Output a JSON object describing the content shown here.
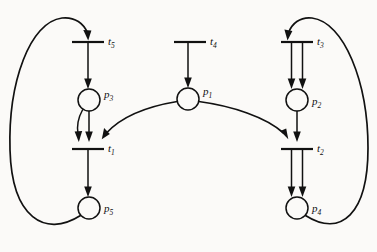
{
  "figure": {
    "kind": "petri-net-diagram",
    "background_color": "#fbfaf8",
    "ink_color": "#111111",
    "width": 377,
    "height": 252
  },
  "places": [
    {
      "id": "p1",
      "label": "p",
      "sub": "1",
      "cx": 188,
      "cy": 99,
      "r": 11,
      "label_x": 203,
      "label_y": 95,
      "tokens": 0
    },
    {
      "id": "p2",
      "label": "p",
      "sub": "2",
      "cx": 297,
      "cy": 100,
      "r": 11,
      "label_x": 312,
      "label_y": 105,
      "tokens": 0
    },
    {
      "id": "p3",
      "label": "p",
      "sub": "3",
      "cx": 89,
      "cy": 100,
      "r": 11,
      "label_x": 104,
      "label_y": 98,
      "tokens": 0
    },
    {
      "id": "p4",
      "label": "p",
      "sub": "4",
      "cx": 297,
      "cy": 208,
      "r": 11,
      "label_x": 312,
      "label_y": 212,
      "tokens": 0
    },
    {
      "id": "p5",
      "label": "p",
      "sub": "5",
      "cx": 89,
      "cy": 208,
      "r": 11,
      "label_x": 104,
      "label_y": 212,
      "tokens": 0
    }
  ],
  "transitions": [
    {
      "id": "t1",
      "label": "t",
      "sub": "1",
      "x": 88,
      "y": 149,
      "half_width": 16,
      "label_x": 108,
      "label_y": 152
    },
    {
      "id": "t2",
      "label": "t",
      "sub": "2",
      "x": 297,
      "y": 149,
      "half_width": 16,
      "label_x": 317,
      "label_y": 152
    },
    {
      "id": "t3",
      "label": "t",
      "sub": "3",
      "x": 297,
      "y": 42,
      "half_width": 16,
      "label_x": 317,
      "label_y": 45
    },
    {
      "id": "t4",
      "label": "t",
      "sub": "4",
      "x": 190,
      "y": 42,
      "half_width": 16,
      "label_x": 210,
      "label_y": 45
    },
    {
      "id": "t5",
      "label": "t",
      "sub": "5",
      "x": 88,
      "y": 42,
      "half_width": 16,
      "label_x": 108,
      "label_y": 45
    }
  ],
  "arcs": [
    {
      "from": "t5",
      "to": "p3",
      "weight": 1,
      "shape": "straight-down"
    },
    {
      "from": "p3",
      "to": "t1",
      "weight": 2,
      "shape": "double-down"
    },
    {
      "from": "t1",
      "to": "p5",
      "weight": 1,
      "shape": "straight-down"
    },
    {
      "from": "p5",
      "to": "t5",
      "weight": 1,
      "shape": "left-feedback-loop"
    },
    {
      "from": "t4",
      "to": "p1",
      "weight": 1,
      "shape": "straight-down"
    },
    {
      "from": "p1",
      "to": "t1",
      "weight": 1,
      "shape": "curve-left"
    },
    {
      "from": "p1",
      "to": "t2",
      "weight": 1,
      "shape": "curve-right"
    },
    {
      "from": "t3",
      "to": "p2",
      "weight": 2,
      "shape": "double-down"
    },
    {
      "from": "p2",
      "to": "t2",
      "weight": 1,
      "shape": "straight-down"
    },
    {
      "from": "t2",
      "to": "p4",
      "weight": 2,
      "shape": "double-down"
    },
    {
      "from": "p4",
      "to": "t3",
      "weight": 1,
      "shape": "right-feedback-loop"
    }
  ]
}
